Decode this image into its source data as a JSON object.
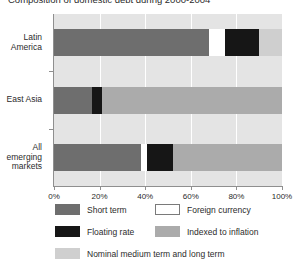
{
  "title": "Composition of domestic debt during 2000-2004",
  "chart_data": {
    "type": "bar",
    "orientation": "horizontal",
    "stacked": true,
    "title": "Composition of domestic debt during 2000-2004",
    "xlabel": "",
    "ylabel": "",
    "xlim": [
      0,
      100
    ],
    "xticks": [
      "0%",
      "20%",
      "40%",
      "60%",
      "80%",
      "100%"
    ],
    "xtick_values": [
      0,
      20,
      40,
      60,
      80,
      100
    ],
    "grid": true,
    "legend_position": "bottom",
    "categories": [
      "Latin America",
      "East Asia",
      "All emerging markets"
    ],
    "series": [
      {
        "name": "Short term",
        "color": "#6e6e6e",
        "values": [
          68,
          16.5,
          38
        ]
      },
      {
        "name": "Foreign currency",
        "color": "#ffffff",
        "values": [
          7,
          0,
          3
        ]
      },
      {
        "name": "Floating rate",
        "color": "#161616",
        "values": [
          15,
          4.5,
          11
        ]
      },
      {
        "name": "Indexed to inflation",
        "color": "#ababab",
        "values": [
          0,
          79,
          48
        ]
      },
      {
        "name": "Nominal medium term and long term",
        "color": "#cfcfcf",
        "values": [
          10,
          0,
          0
        ]
      }
    ]
  },
  "categories_display": [
    {
      "lines": [
        "Latin",
        "America"
      ]
    },
    {
      "lines": [
        "East Asia"
      ]
    },
    {
      "lines": [
        "All",
        "emerging",
        "markets"
      ]
    }
  ],
  "legend": {
    "rows": [
      [
        {
          "label": "Short term",
          "color": "#6e6e6e",
          "border": "#6e6e6e"
        },
        {
          "label": "Foreign currency",
          "color": "#ffffff",
          "border": "#7a7a7a"
        }
      ],
      [
        {
          "label": "Floating rate",
          "color": "#161616",
          "border": "#161616"
        },
        {
          "label": "Indexed to inflation",
          "color": "#ababab",
          "border": "#ababab"
        }
      ],
      [
        {
          "label": "Nominal medium term and long term",
          "color": "#cfcfcf",
          "border": "#cfcfcf"
        }
      ]
    ]
  },
  "colors": {
    "plot_background": "#e4e4e4",
    "gridline": "#ffffff",
    "axis": "#8f8f8f",
    "text": "#2b2b2b",
    "page_background": "#ffffff"
  }
}
